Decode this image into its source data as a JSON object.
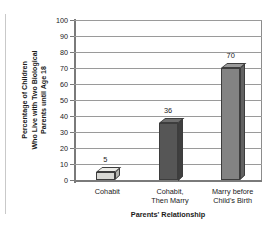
{
  "chart_data": {
    "type": "bar",
    "title": "",
    "categories": [
      "Cohabit",
      "Cohabit, Then Marry",
      "Marry before Child's Birth"
    ],
    "category_lines": [
      [
        "Cohabit"
      ],
      [
        "Cohabit,",
        "Then Marry"
      ],
      [
        "Marry before",
        "Child's Birth"
      ]
    ],
    "values": [
      5,
      36,
      70
    ],
    "value_labels": [
      "5",
      "36",
      "70"
    ],
    "xlabel": "Parents' Relationship",
    "ylabel": "Percentage of Children Who Live with Two Biological Parents until Age 18",
    "ylabel_lines": [
      "Percentage of Children",
      "Who Live with Two Biological",
      "Parents until Age 18"
    ],
    "ylim": [
      0,
      100
    ],
    "ytick_labels": [
      "0",
      "10",
      "20",
      "30",
      "40",
      "50",
      "60",
      "70",
      "80",
      "90",
      "100"
    ],
    "ytick_values": [
      0,
      10,
      20,
      30,
      40,
      50,
      60,
      70,
      80,
      90,
      100
    ],
    "grid": true,
    "legend": "none",
    "bar_colors": [
      "#d8d8d4",
      "#565656",
      "#838383"
    ],
    "bar_top_colors": [
      "#ebebe7",
      "#6d6d6d",
      "#9a9a9a"
    ],
    "bar_side_colors": [
      "#b4b4b0",
      "#3f3f3f",
      "#626262"
    ],
    "axis_color": "#7a7a7a",
    "grid_color": "#9a9a9a",
    "text_color": "#1a1a1a",
    "background": "#ffffff"
  }
}
